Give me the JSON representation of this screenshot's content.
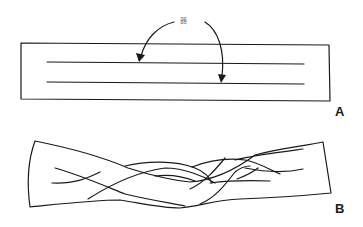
{
  "figure": {
    "panel_a": {
      "label": "A",
      "callout_text": "器",
      "description": "Rectangular strip with two parallel incision lines, arrows pointing to each line"
    },
    "panel_b": {
      "label": "B",
      "description": "Strip cut into three strands and braided"
    },
    "colors": {
      "line": "#1a1a1a",
      "background": "#ffffff"
    }
  }
}
